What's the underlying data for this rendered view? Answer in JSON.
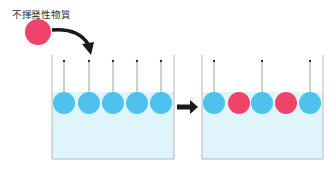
{
  "label": "不揮発性物質",
  "colors": {
    "solvent": "#4fc1ef",
    "solute": "#f0436a",
    "water": "#dff5fb",
    "wall": "#b8b8b8",
    "arrow": "#1a1a1a"
  },
  "before": {
    "particles": [
      "solvent",
      "solvent",
      "solvent",
      "solvent",
      "solvent"
    ],
    "evaporating": [
      true,
      true,
      true,
      true,
      true
    ]
  },
  "after": {
    "particles": [
      "solvent",
      "solute",
      "solvent",
      "solute",
      "solvent"
    ],
    "evaporating": [
      true,
      false,
      true,
      false,
      true
    ]
  }
}
